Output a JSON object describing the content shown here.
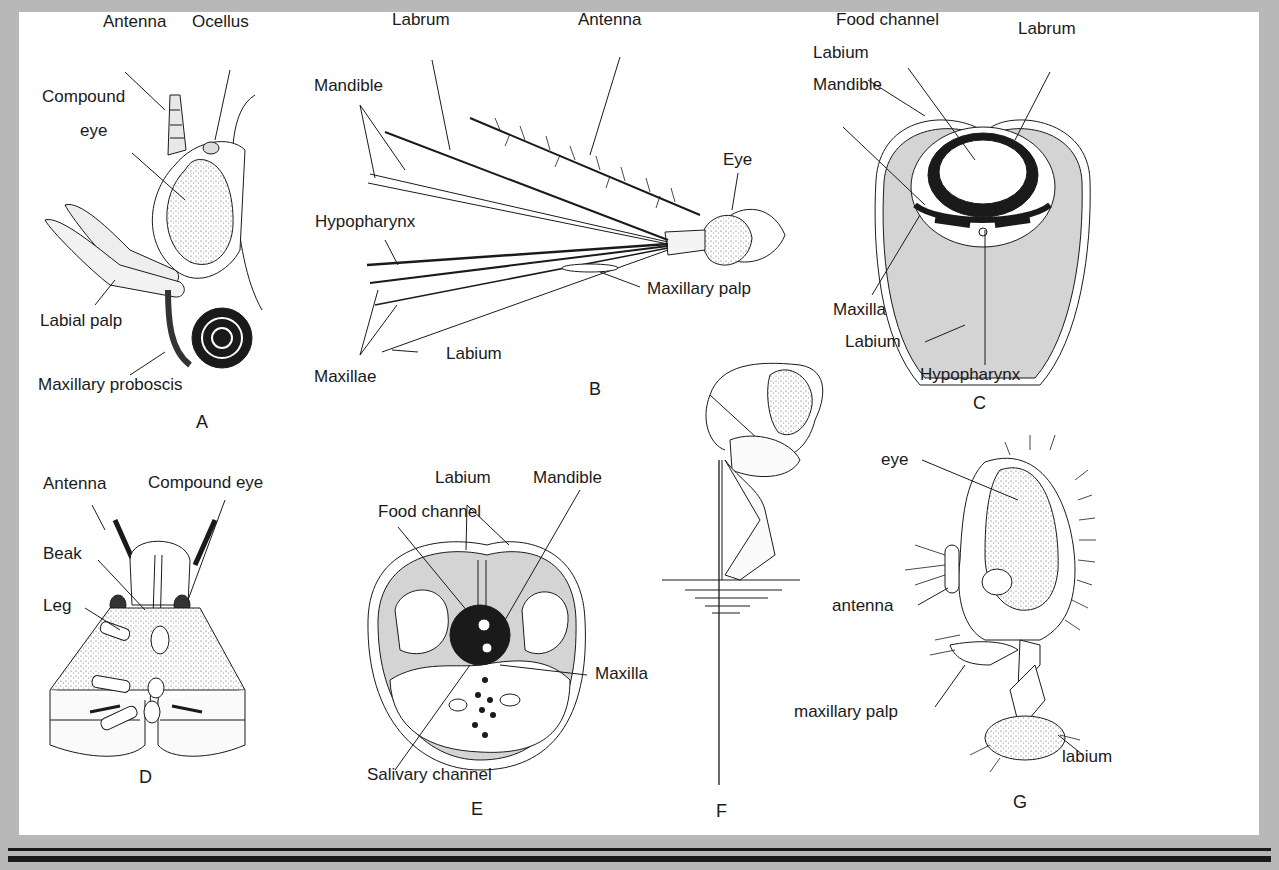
{
  "diagram": {
    "panels": [
      {
        "id": "A",
        "labels": [
          "Antenna",
          "Ocellus",
          "Compound eye",
          "Labial palp",
          "Maxillary proboscis"
        ]
      },
      {
        "id": "B",
        "labels": [
          "Labrum",
          "Antenna",
          "Mandible",
          "Eye",
          "Hypopharynx",
          "Maxillary palp",
          "Labium",
          "Maxillae"
        ]
      },
      {
        "id": "C",
        "labels": [
          "Food channel",
          "Labrum",
          "Labium",
          "Mandible",
          "Maxilla",
          "Labium",
          "Hypopharynx"
        ]
      },
      {
        "id": "D",
        "labels": [
          "Antenna",
          "Compound eye",
          "Beak",
          "Leg"
        ]
      },
      {
        "id": "E",
        "labels": [
          "Labium",
          "Mandible",
          "Food channel",
          "Maxilla",
          "Salivary channel"
        ]
      },
      {
        "id": "F",
        "labels": []
      },
      {
        "id": "G",
        "labels": [
          "eye",
          "antenna",
          "maxillary palp",
          "labium"
        ]
      }
    ]
  },
  "A": {
    "antenna": "Antenna",
    "ocellus": "Ocellus",
    "compound1": "Compound",
    "compound2": "eye",
    "labial_palp": "Labial palp",
    "proboscis": "Maxillary proboscis",
    "fig": "A"
  },
  "B": {
    "labrum": "Labrum",
    "antenna": "Antenna",
    "mandible": "Mandible",
    "eye": "Eye",
    "hypopharynx": "Hypopharynx",
    "maxillary_palp": "Maxillary palp",
    "labium": "Labium",
    "maxillae": "Maxillae",
    "fig": "B"
  },
  "C": {
    "food_channel": "Food channel",
    "labrum": "Labrum",
    "labium_top": "Labium",
    "mandible": "Mandible",
    "maxilla": "Maxilla",
    "labium_bottom": "Labium",
    "hypopharynx": "Hypopharynx",
    "fig": "C"
  },
  "D": {
    "antenna": "Antenna",
    "compound_eye": "Compound eye",
    "beak": "Beak",
    "leg": "Leg",
    "fig": "D"
  },
  "E": {
    "labium": "Labium",
    "mandible": "Mandible",
    "food_channel": "Food channel",
    "maxilla": "Maxilla",
    "salivary_channel": "Salivary channel",
    "fig": "E"
  },
  "F": {
    "fig": "F"
  },
  "G": {
    "eye": "eye",
    "antenna": "antenna",
    "maxillary_palp": "maxillary palp",
    "labium": "labium",
    "fig": "G"
  },
  "colors": {
    "frame": "#b8b8b8",
    "panel": "#ffffff",
    "ink": "#1a1a1a",
    "tissue": "#d4d4d4"
  }
}
